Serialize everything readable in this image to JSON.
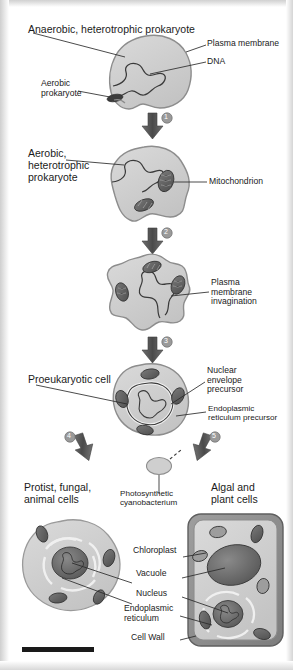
{
  "figure": {
    "type": "process-flow-diagram",
    "background_color": "#ffffff",
    "cell_fill": "#cfcfcf",
    "cell_stroke": "#8d8d8d",
    "organelle_fill": "#6b6b6b",
    "arrow_color": "#5a5a5a",
    "leader_color": "#2a2a2a",
    "badge_color": "#9a9a9a"
  },
  "stages": [
    {
      "id": "stage-1",
      "label": "Anaerobic, heterotrophic prokaryote",
      "callouts": [
        {
          "name": "plasma-membrane",
          "text": "Plasma membrane"
        },
        {
          "name": "dna",
          "text": "DNA"
        },
        {
          "name": "aerobic-prokaryote",
          "text": "Aerobic\nprokaryote"
        }
      ]
    },
    {
      "id": "stage-2",
      "label": "Aerobic,\nheterotrophic\nprokaryote",
      "callouts": [
        {
          "name": "mitochondrion",
          "text": "Mitochondrion"
        }
      ]
    },
    {
      "id": "stage-3",
      "label": "",
      "callouts": [
        {
          "name": "plasma-membrane-invagination",
          "text": "Plasma\nmembrane\ninvagination"
        }
      ]
    },
    {
      "id": "stage-4",
      "label": "Proeukaryotic cell",
      "callouts": [
        {
          "name": "nuclear-envelope-precursor",
          "text": "Nuclear\nenvelope\nprecursor"
        },
        {
          "name": "endoplasmic-reticulum-precursor",
          "text": "Endoplasmic\nreticulum precursor"
        }
      ]
    }
  ],
  "branches": {
    "left": {
      "label": "Protist, fungal,\nanimal cells",
      "step": "4"
    },
    "right": {
      "label": "Algal and\nplant cells",
      "step": "5"
    },
    "middle": {
      "label": "Photosynthetic\ncyanobacterium"
    }
  },
  "steps": [
    {
      "number": "1"
    },
    {
      "number": "2"
    },
    {
      "number": "3"
    },
    {
      "number": "4"
    },
    {
      "number": "5"
    }
  ],
  "final_cell_labels": [
    {
      "name": "chloroplast",
      "text": "Chloroplast"
    },
    {
      "name": "vacuole",
      "text": "Vacuole"
    },
    {
      "name": "nucleus",
      "text": "Nucleus"
    },
    {
      "name": "endoplasmic-reticulum",
      "text": "Endoplasmic\nreticulum"
    },
    {
      "name": "cell-wall",
      "text": "Cell Wall"
    }
  ]
}
